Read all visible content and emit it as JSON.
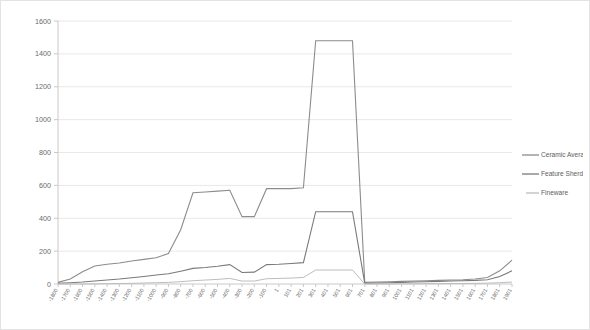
{
  "chart_data": {
    "type": "line",
    "title": "",
    "xlabel": "",
    "ylabel": "",
    "ylim": [
      0,
      1600
    ],
    "ytick_step": 200,
    "yticks": [
      0,
      200,
      400,
      600,
      800,
      1000,
      1200,
      1400,
      1600
    ],
    "grid": true,
    "legend_position": "right",
    "background": "#ffffff",
    "categories": [
      "-1800",
      "-1700",
      "-1600",
      "-1500",
      "-1400",
      "-1300",
      "-1200",
      "-1100",
      "-1000",
      "-900",
      "-800",
      "-700",
      "-600",
      "-500",
      "-400",
      "-300",
      "-200",
      "-100",
      "1",
      "101",
      "201",
      "301",
      "401",
      "501",
      "601",
      "701",
      "801",
      "901",
      "1001",
      "1101",
      "1201",
      "1301",
      "1401",
      "1501",
      "1601",
      "1701",
      "1801",
      "1901"
    ],
    "series": [
      {
        "name": "Ceramic Averages",
        "color": "#8c8c8c",
        "values": [
          10,
          30,
          75,
          110,
          120,
          128,
          140,
          150,
          160,
          185,
          330,
          555,
          560,
          565,
          570,
          410,
          410,
          580,
          580,
          580,
          585,
          1480,
          1480,
          1480,
          1480,
          10,
          12,
          14,
          16,
          18,
          20,
          22,
          24,
          26,
          30,
          40,
          80,
          145
        ]
      },
      {
        "name": "Feature Sherds",
        "color": "#7a7a7a",
        "values": [
          5,
          8,
          12,
          18,
          24,
          30,
          38,
          46,
          55,
          62,
          78,
          95,
          100,
          108,
          118,
          70,
          72,
          118,
          120,
          125,
          130,
          440,
          440,
          440,
          440,
          5,
          6,
          8,
          10,
          12,
          14,
          16,
          18,
          20,
          22,
          26,
          45,
          80
        ]
      },
      {
        "name": "Fineware",
        "color": "#bdbdbd",
        "values": [
          0,
          0,
          0,
          1,
          2,
          3,
          4,
          6,
          8,
          10,
          14,
          20,
          24,
          28,
          34,
          18,
          18,
          32,
          34,
          36,
          40,
          85,
          85,
          85,
          85,
          0,
          0,
          0,
          1,
          1,
          2,
          2,
          3,
          3,
          4,
          5,
          8,
          12
        ]
      }
    ]
  },
  "legend": {
    "items": [
      {
        "label": "Ceramic Averages"
      },
      {
        "label": "Feature Sherds"
      },
      {
        "label": "Fineware"
      }
    ]
  }
}
